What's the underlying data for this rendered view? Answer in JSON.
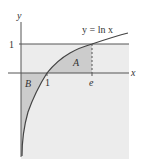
{
  "figure": {
    "curve_label": "y = ln x",
    "axis_labels": {
      "x": "x",
      "y": "y"
    },
    "tick_labels": {
      "y_one": "1",
      "x_one": "1",
      "x_e": "e"
    },
    "region_labels": {
      "A": "A",
      "B": "B"
    },
    "colors": {
      "background_shade": "#ececec",
      "region_shade": "#cccccc",
      "line": "#444444",
      "text": "#333333"
    }
  }
}
